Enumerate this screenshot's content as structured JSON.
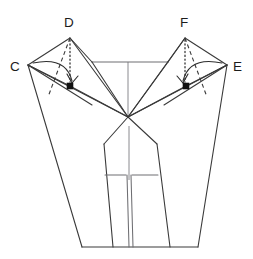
{
  "figure": {
    "type": "geometric-fold-diagram",
    "background_color": "#ffffff",
    "line_color": "#3a3a3a",
    "light_line_color": "#6e6e72",
    "axis_color": "#8a8a8f",
    "marker_color": "#111111",
    "width": 253,
    "height": 259
  },
  "labels": {
    "c": "C",
    "d": "D",
    "e": "E",
    "f": "F"
  },
  "geometry": {
    "vertex_c": {
      "x": 28,
      "y": 65
    },
    "vertex_d": {
      "x": 70,
      "y": 38
    },
    "vertex_e": {
      "x": 227,
      "y": 65
    },
    "vertex_f": {
      "x": 185,
      "y": 38
    },
    "marker_left": {
      "x": 70,
      "y": 86
    },
    "marker_right": {
      "x": 186,
      "y": 86
    },
    "center_apex": {
      "x": 128,
      "y": 117
    },
    "top_bar_left": {
      "x": 92,
      "y": 62
    },
    "top_bar_right": {
      "x": 168,
      "y": 62
    },
    "body_left_shoulder": {
      "x": 104,
      "y": 144
    },
    "body_right_shoulder": {
      "x": 157,
      "y": 144
    },
    "base_left": {
      "x": 113,
      "y": 247
    },
    "base_right": {
      "x": 170,
      "y": 247
    },
    "outer_left_foot": {
      "x": 82,
      "y": 247
    },
    "outer_right_foot": {
      "x": 198,
      "y": 247
    }
  },
  "annotations": {
    "fold_arrow_left": "curved-fold-arrow-left",
    "fold_arrow_right": "curved-fold-arrow-right",
    "projection_left": "dotted-projection-left",
    "projection_right": "dotted-projection-right",
    "crease_left": "dashed-crease-left",
    "crease_right": "dashed-crease-right"
  }
}
